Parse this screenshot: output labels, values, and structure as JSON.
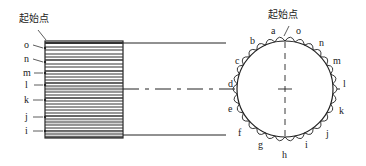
{
  "diagram": {
    "start_label_left": "起始点",
    "start_label_right": "起始点",
    "left_labels": [
      "o",
      "n",
      "m",
      "l",
      "k",
      "j",
      "i"
    ],
    "circle_labels": {
      "a": "a",
      "b": "b",
      "c": "c",
      "d": "d",
      "e": "e",
      "f": "f",
      "g": "g",
      "h": "h",
      "i": "i",
      "j": "j",
      "k": "k",
      "l": "l",
      "m": "m",
      "n": "n",
      "o": "o"
    }
  }
}
